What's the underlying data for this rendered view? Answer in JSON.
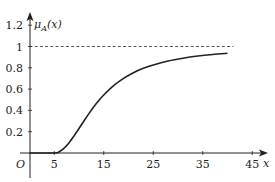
{
  "chart_data": {
    "type": "line",
    "title": "",
    "xlabel": "x",
    "ylabel": "μ_A(x)",
    "origin_label": "O",
    "xlim": [
      0,
      48
    ],
    "ylim": [
      0,
      1.3
    ],
    "x_ticks": [
      5,
      15,
      25,
      35,
      45
    ],
    "x_tick_labels": [
      "5",
      "15",
      "25",
      "35",
      "45"
    ],
    "y_ticks": [
      0.2,
      0.4,
      0.6,
      0.8,
      1,
      1.2
    ],
    "y_tick_labels": [
      "0.2",
      "0.4",
      "0.6",
      "0.8",
      "1",
      "1.2"
    ],
    "grid": false,
    "legend": null,
    "annotations": [
      {
        "type": "dashed-horizontal-line",
        "y": 1,
        "x_from": 0,
        "x_to": 41
      }
    ],
    "series": [
      {
        "name": "μ_A(x)",
        "x": [
          0,
          5,
          6,
          7,
          8,
          9,
          10,
          11,
          12,
          13,
          14,
          15,
          17,
          19,
          21,
          23,
          25,
          28,
          31,
          34,
          37,
          40
        ],
        "values": [
          0,
          0,
          0.012,
          0.046,
          0.097,
          0.161,
          0.23,
          0.301,
          0.37,
          0.434,
          0.492,
          0.545,
          0.633,
          0.701,
          0.754,
          0.795,
          0.827,
          0.864,
          0.89,
          0.91,
          0.925,
          0.936
        ]
      }
    ],
    "colors": {
      "axis": "#222222",
      "curve": "#222222",
      "dashed": "#444444"
    }
  }
}
